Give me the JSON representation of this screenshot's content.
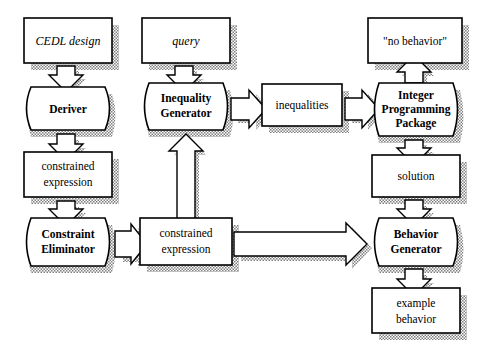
{
  "diagram": {
    "background_color": "#ffffff",
    "stroke_color": "#000000",
    "shadow_color": "#8c8c8c",
    "nodes": [
      {
        "id": "cedl_design",
        "label": "CEDL design",
        "kind": "data",
        "style": "italic",
        "x": 24,
        "y": 18,
        "w": 88,
        "h": 45
      },
      {
        "id": "query",
        "label": "query",
        "kind": "data",
        "style": "italic",
        "x": 142,
        "y": 18,
        "w": 88,
        "h": 45
      },
      {
        "id": "no_behavior",
        "label": "\"no behavior\"",
        "kind": "data",
        "style": "regular",
        "x": 368,
        "y": 18,
        "w": 94,
        "h": 45
      },
      {
        "id": "deriver",
        "label": "Deriver",
        "kind": "process",
        "style": "bold",
        "x": 24,
        "y": 87,
        "w": 88,
        "h": 43
      },
      {
        "id": "ineq_gen",
        "label": "Inequality|Generator",
        "kind": "process",
        "style": "bold",
        "x": 142,
        "y": 83,
        "w": 88,
        "h": 47
      },
      {
        "id": "inequalities",
        "label": "inequalities",
        "kind": "data",
        "style": "regular",
        "x": 262,
        "y": 84,
        "w": 80,
        "h": 42
      },
      {
        "id": "ip_package",
        "label": "Integer|Programming|Package",
        "kind": "process",
        "style": "bold",
        "x": 372,
        "y": 83,
        "w": 88,
        "h": 53
      },
      {
        "id": "constrained_1",
        "label": "constrained|expression",
        "kind": "data",
        "style": "regular",
        "x": 24,
        "y": 152,
        "w": 88,
        "h": 45
      },
      {
        "id": "solution",
        "label": "solution",
        "kind": "data",
        "style": "regular",
        "x": 372,
        "y": 155,
        "w": 88,
        "h": 42
      },
      {
        "id": "constr_elim",
        "label": "Constraint|Eliminator",
        "kind": "process",
        "style": "bold",
        "x": 24,
        "y": 218,
        "w": 88,
        "h": 48
      },
      {
        "id": "constrained_2",
        "label": "constrained|expression",
        "kind": "data",
        "style": "regular",
        "x": 140,
        "y": 218,
        "w": 92,
        "h": 47
      },
      {
        "id": "behavior_gen",
        "label": "Behavior|Generator",
        "kind": "process",
        "style": "bold",
        "x": 372,
        "y": 218,
        "w": 88,
        "h": 48
      },
      {
        "id": "example_behav",
        "label": "example|behavior",
        "kind": "data",
        "style": "regular",
        "x": 372,
        "y": 288,
        "w": 88,
        "h": 45
      }
    ],
    "edges": [
      {
        "id": "e1",
        "from": "cedl_design",
        "to": "deriver",
        "direction": "down",
        "kind": "block-arrow"
      },
      {
        "id": "e2",
        "from": "deriver",
        "to": "constrained_1",
        "direction": "down",
        "kind": "block-arrow"
      },
      {
        "id": "e3",
        "from": "constrained_1",
        "to": "constr_elim",
        "direction": "down",
        "kind": "block-arrow"
      },
      {
        "id": "e4",
        "from": "constr_elim",
        "to": "constrained_2",
        "direction": "right",
        "kind": "block-arrow"
      },
      {
        "id": "e5",
        "from": "constrained_2",
        "to": "ineq_gen",
        "direction": "up",
        "kind": "block-arrow"
      },
      {
        "id": "e6",
        "from": "query",
        "to": "ineq_gen",
        "direction": "down",
        "kind": "block-arrow"
      },
      {
        "id": "e7",
        "from": "ineq_gen",
        "to": "inequalities",
        "direction": "right",
        "kind": "block-arrow"
      },
      {
        "id": "e8",
        "from": "inequalities",
        "to": "ip_package",
        "direction": "right",
        "kind": "block-arrow"
      },
      {
        "id": "e9",
        "from": "ip_package",
        "to": "no_behavior",
        "direction": "up",
        "kind": "block-arrow"
      },
      {
        "id": "e10",
        "from": "ip_package",
        "to": "solution",
        "direction": "down",
        "kind": "block-arrow"
      },
      {
        "id": "e11",
        "from": "solution",
        "to": "behavior_gen",
        "direction": "down",
        "kind": "block-arrow"
      },
      {
        "id": "e12",
        "from": "constrained_2",
        "to": "behavior_gen",
        "direction": "right",
        "kind": "block-arrow-long"
      },
      {
        "id": "e13",
        "from": "behavior_gen",
        "to": "example_behav",
        "direction": "down",
        "kind": "block-arrow"
      }
    ]
  }
}
